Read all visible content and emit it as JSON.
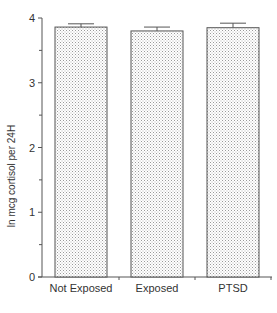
{
  "chart_data": {
    "type": "bar",
    "title": "",
    "xlabel": "",
    "ylabel": "ln mcg cortisol per 24H",
    "categories": [
      "Not Exposed",
      "Exposed",
      "PTSD"
    ],
    "values": [
      3.86,
      3.8,
      3.85
    ],
    "error_bars": [
      0.05,
      0.06,
      0.07
    ],
    "ylim": [
      0,
      4
    ],
    "yticks": [
      0,
      1,
      2,
      3,
      4
    ],
    "minor_yticks": [
      0.5,
      1.5,
      2.5,
      3.5
    ],
    "grid": false,
    "legend": null,
    "bar_fill": "stippled light gray",
    "colors": {
      "bar_edge": "#555555",
      "dot": "#9a9a9a",
      "axis": "#555555",
      "text": "#333333"
    }
  }
}
